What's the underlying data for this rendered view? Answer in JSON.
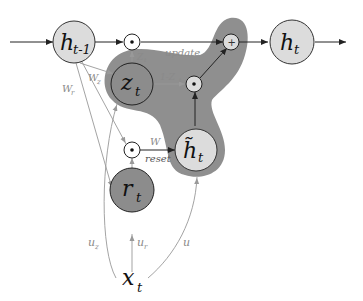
{
  "diagram": {
    "colors": {
      "light_node": "#dcdcdc",
      "dark_node": "#8c8c8c",
      "highlight_blob": "#8f8f8f",
      "edge_dark": "#222222",
      "edge_light": "#9a9a9a",
      "label_gray": "#8a8a8a"
    },
    "nodes": {
      "h_prev": {
        "main": "h",
        "sub": "t-1"
      },
      "h_t": {
        "main": "h",
        "sub": "t"
      },
      "z_t": {
        "main": "z",
        "sub": "t"
      },
      "r_t": {
        "main": "r",
        "sub": "t"
      },
      "h_tilde": {
        "main": "h̃",
        "sub": "t"
      },
      "x_t": {
        "main": "x",
        "sub": "t"
      }
    },
    "operators": {
      "mult_top": "•",
      "mult_mid": "•",
      "mult_reset": "•",
      "add": "+"
    },
    "edge_labels": {
      "update": "update",
      "reset": "reset",
      "W": "W",
      "W_r": "W",
      "W_r_sub": "r",
      "W_z": "W",
      "W_z_sub": "z",
      "z_top": "Z",
      "z_top_sub": "t",
      "one_minus_z": "1-Z",
      "one_minus_z_sub": "t",
      "u_z": "u",
      "u_z_sub": "z",
      "u_r": "u",
      "u_r_sub": "r",
      "u": "u"
    }
  }
}
